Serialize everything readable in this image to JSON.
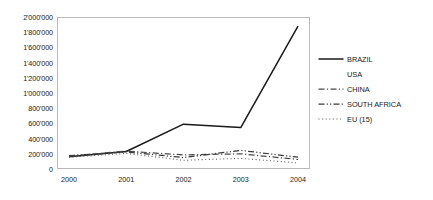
{
  "chart_data": {
    "type": "line",
    "title": "",
    "xlabel": "",
    "ylabel": "",
    "x": [
      "2000",
      "2001",
      "2002",
      "2003",
      "2004"
    ],
    "categories": [
      "2000",
      "2001",
      "2002",
      "2003",
      "2004"
    ],
    "ylim": [
      0,
      2000000
    ],
    "ytick_values": [
      0,
      200000,
      400000,
      600000,
      800000,
      1000000,
      1200000,
      1400000,
      1600000,
      1800000,
      2000000
    ],
    "ytick_labels": [
      "0",
      "200'000",
      "400'000",
      "600'000",
      "800'000",
      "1'000'000",
      "1'200'000",
      "1'400'000",
      "1'600'000",
      "1'800'000",
      "2'000'000"
    ],
    "grid": false,
    "legend_position": "right",
    "series": [
      {
        "name": "BRAZIL",
        "style": "solid",
        "color": "#1a1a1a",
        "values": [
          160000,
          230000,
          590000,
          545000,
          1880000
        ]
      },
      {
        "name": "USA",
        "style": "none",
        "color": "#1a1a1a",
        "values": [
          165000,
          215000,
          160000,
          150000,
          140000
        ]
      },
      {
        "name": "CHINA",
        "style": "dash-dot",
        "color": "#4a4a4a",
        "values": [
          170000,
          235000,
          185000,
          200000,
          125000
        ]
      },
      {
        "name": "SOUTH AFRICA",
        "style": "dash-dot-dot",
        "color": "#3a3a3a",
        "values": [
          175000,
          225000,
          150000,
          245000,
          155000
        ]
      },
      {
        "name": "EU (15)",
        "style": "dotted",
        "color": "#5a5a5a",
        "values": [
          155000,
          205000,
          115000,
          140000,
          80000
        ]
      }
    ]
  }
}
